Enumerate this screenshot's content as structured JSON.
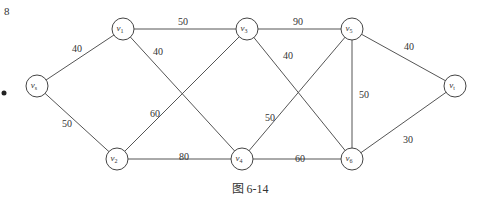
{
  "figure": {
    "caption": "图 6-14",
    "corner_mark": "8",
    "colors": {
      "line": "#555555",
      "node_stroke": "#444444",
      "text": "#333333",
      "background": "#ffffff"
    }
  },
  "graph": {
    "nodes": [
      {
        "id": "vs",
        "label": "v",
        "sub": "s",
        "x": 37,
        "y": 86
      },
      {
        "id": "v1",
        "label": "v",
        "sub": "1",
        "x": 123,
        "y": 29
      },
      {
        "id": "v2",
        "label": "v",
        "sub": "2",
        "x": 117,
        "y": 159
      },
      {
        "id": "v3",
        "label": "v",
        "sub": "3",
        "x": 247,
        "y": 29
      },
      {
        "id": "v4",
        "label": "v",
        "sub": "4",
        "x": 242,
        "y": 159
      },
      {
        "id": "v5",
        "label": "v",
        "sub": "5",
        "x": 352,
        "y": 29
      },
      {
        "id": "v6",
        "label": "v",
        "sub": "6",
        "x": 352,
        "y": 159
      },
      {
        "id": "vt",
        "label": "v",
        "sub": "t",
        "x": 455,
        "y": 86
      }
    ],
    "edges": [
      {
        "from": "vs",
        "to": "v1",
        "weight": "40",
        "lx": 72,
        "ly": 52
      },
      {
        "from": "vs",
        "to": "v2",
        "weight": "50",
        "lx": 62,
        "ly": 127
      },
      {
        "from": "v1",
        "to": "v3",
        "weight": "50",
        "lx": 178,
        "ly": 25
      },
      {
        "from": "v1",
        "to": "v4",
        "weight": "40",
        "lx": 153,
        "ly": 55
      },
      {
        "from": "v2",
        "to": "v3",
        "weight": "60",
        "lx": 150,
        "ly": 117
      },
      {
        "from": "v2",
        "to": "v4",
        "weight": "80",
        "lx": 179,
        "ly": 160
      },
      {
        "from": "v3",
        "to": "v5",
        "weight": "90",
        "lx": 293,
        "ly": 25
      },
      {
        "from": "v3",
        "to": "v6",
        "weight": "40",
        "lx": 283,
        "ly": 59
      },
      {
        "from": "v4",
        "to": "v5",
        "weight": "50",
        "lx": 265,
        "ly": 121
      },
      {
        "from": "v4",
        "to": "v6",
        "weight": "60",
        "lx": 295,
        "ly": 162
      },
      {
        "from": "v5",
        "to": "v6",
        "weight": "50",
        "lx": 359,
        "ly": 98
      },
      {
        "from": "v5",
        "to": "vt",
        "weight": "40",
        "lx": 404,
        "ly": 50
      },
      {
        "from": "v6",
        "to": "vt",
        "weight": "30",
        "lx": 403,
        "ly": 143
      }
    ]
  }
}
